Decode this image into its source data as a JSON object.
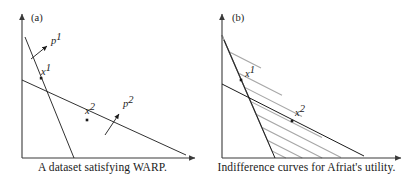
{
  "figure": {
    "width": 409,
    "height": 185,
    "background": "#ffffff",
    "axis_color": "#3a3a3a",
    "budget_color": "#1a1a1a",
    "indifference_color": "#a8a8a8"
  },
  "panels": [
    {
      "tag": "(a)",
      "caption": "A dataset satisfying WARP.",
      "axes": {
        "origin_x": 22,
        "origin_y": 158,
        "x_axis_end": 197,
        "y_axis_top": 12
      },
      "labels": [
        {
          "name": "price-vector-1",
          "base": "p",
          "sup": "1",
          "x": 50,
          "y": 43
        },
        {
          "name": "bundle-1",
          "base": "x",
          "sup": "1",
          "x": 40,
          "y": 74
        },
        {
          "name": "bundle-2",
          "base": "x",
          "sup": "2",
          "x": 84,
          "y": 113
        },
        {
          "name": "price-vector-2",
          "base": "p",
          "sup": "2",
          "x": 122,
          "y": 105
        }
      ],
      "budget_lines": [
        {
          "name": "budget-line-1",
          "x1": 25,
          "y1": 37,
          "x2": 74,
          "y2": 158
        },
        {
          "name": "budget-line-2",
          "x1": 22,
          "y1": 80,
          "x2": 186,
          "y2": 155
        }
      ],
      "bundle_points": [
        {
          "name": "bundle-point-1",
          "x": 41.4,
          "y": 78.5
        },
        {
          "name": "bundle-point-2",
          "x": 87,
          "y": 120
        }
      ],
      "price_arrows": [
        {
          "name": "price-arrow-1",
          "x1": 33,
          "y1": 58,
          "x2": 48,
          "y2": 45
        },
        {
          "name": "price-arrow-2",
          "x1": 106,
          "y1": 134,
          "x2": 120,
          "y2": 114
        }
      ]
    },
    {
      "tag": "(b)",
      "caption": "Indifference curves for Afriat's utility.",
      "axes": {
        "origin_x": 18,
        "origin_y": 158,
        "x_axis_end": 199,
        "y_axis_top": 12
      },
      "labels": [
        {
          "name": "bundle-1",
          "base": "x",
          "sup": "1",
          "x": 45,
          "y": 76
        },
        {
          "name": "bundle-2",
          "base": "x",
          "sup": "2",
          "x": 92,
          "y": 115
        }
      ],
      "budget_lines": [
        {
          "name": "budget-line-1",
          "x1": 20,
          "y1": 40,
          "x2": 71,
          "y2": 158
        },
        {
          "name": "budget-line-2",
          "x1": 18,
          "y1": 84,
          "x2": 160,
          "y2": 156
        }
      ],
      "bundle_points": [
        {
          "name": "bundle-point-1",
          "x": 37,
          "y": 80
        },
        {
          "name": "bundle-point-2",
          "x": 88,
          "y": 121
        }
      ],
      "indifference_curves": [
        {
          "name": "indifference-curve-1",
          "y_intercept": 14,
          "kink_t": 0.1,
          "x_intercept": 57
        },
        {
          "name": "indifference-curve-2",
          "y_intercept": 52,
          "kink_t": 0.28,
          "x_intercept": 78
        },
        {
          "name": "indifference-curve-3",
          "y_intercept": 66,
          "kink_t": 0.4,
          "x_intercept": 98
        },
        {
          "name": "indifference-curve-4",
          "y_intercept": 80,
          "kink_t": 0.52,
          "x_intercept": 118
        },
        {
          "name": "indifference-curve-5",
          "y_intercept": 94,
          "kink_t": 0.63,
          "x_intercept": 137
        },
        {
          "name": "indifference-curve-6",
          "y_intercept": 108,
          "kink_t": 0.74,
          "x_intercept": 155
        },
        {
          "name": "indifference-curve-7",
          "y_intercept": 122,
          "kink_t": 0.85,
          "x_intercept": 172
        },
        {
          "name": "indifference-curve-8",
          "y_intercept": 136,
          "kink_t": 0.94,
          "x_intercept": 188
        }
      ]
    }
  ]
}
